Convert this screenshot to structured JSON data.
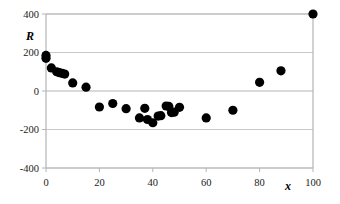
{
  "chart_data": {
    "type": "scatter",
    "title": "",
    "xlabel": "x",
    "ylabel": "R",
    "xlim": [
      0,
      100
    ],
    "ylim": [
      -400,
      400
    ],
    "grid": true,
    "legend": null,
    "x_ticks": [
      0,
      20,
      40,
      60,
      80,
      100
    ],
    "y_ticks": [
      -400,
      -200,
      0,
      200,
      400
    ],
    "x_tick_labels": [
      "0",
      "20",
      "40",
      "60",
      "80",
      "100"
    ],
    "y_tick_labels": [
      "-400",
      "-200",
      "0",
      "200",
      "400"
    ],
    "marker": {
      "shape": "circle",
      "color": "#000000",
      "size": 6
    },
    "series": [
      {
        "name": "R",
        "points": [
          {
            "x": 0,
            "y": 185
          },
          {
            "x": 0,
            "y": 170
          },
          {
            "x": 2,
            "y": 120
          },
          {
            "x": 4,
            "y": 100
          },
          {
            "x": 5,
            "y": 95
          },
          {
            "x": 6,
            "y": 92
          },
          {
            "x": 7,
            "y": 88
          },
          {
            "x": 10,
            "y": 42
          },
          {
            "x": 15,
            "y": 20
          },
          {
            "x": 20,
            "y": -83
          },
          {
            "x": 25,
            "y": -65
          },
          {
            "x": 30,
            "y": -92
          },
          {
            "x": 35,
            "y": -140
          },
          {
            "x": 37,
            "y": -90
          },
          {
            "x": 38,
            "y": -148
          },
          {
            "x": 40,
            "y": -165
          },
          {
            "x": 42,
            "y": -130
          },
          {
            "x": 43,
            "y": -128
          },
          {
            "x": 45,
            "y": -78
          },
          {
            "x": 46,
            "y": -80
          },
          {
            "x": 47,
            "y": -112
          },
          {
            "x": 48,
            "y": -110
          },
          {
            "x": 50,
            "y": -85
          },
          {
            "x": 60,
            "y": -140
          },
          {
            "x": 70,
            "y": -100
          },
          {
            "x": 80,
            "y": 45
          },
          {
            "x": 88,
            "y": 105
          },
          {
            "x": 100,
            "y": 400
          }
        ]
      }
    ],
    "colors": {
      "marker": "#000000",
      "frame": "#b4b4b4",
      "gridline": "#c8c8c8",
      "zero_line": "#b4b4b4",
      "background": "#ffffff"
    }
  }
}
